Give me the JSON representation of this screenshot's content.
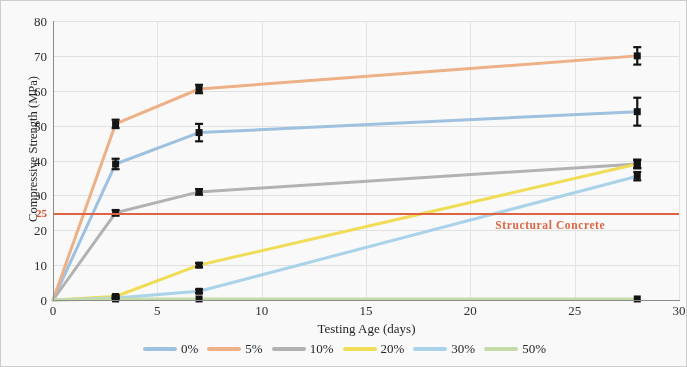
{
  "chart_data": {
    "type": "line",
    "title": "",
    "xlabel": "Testing Age (days)",
    "ylabel": "Compressive Strength (MPa)",
    "xlim": [
      0,
      30
    ],
    "ylim": [
      0,
      80
    ],
    "xticks": [
      0,
      5,
      10,
      15,
      20,
      25,
      30
    ],
    "yticks": [
      0,
      10,
      20,
      30,
      40,
      50,
      60,
      70,
      80
    ],
    "grid": true,
    "legend_position": "bottom",
    "x": [
      0,
      3,
      7,
      28
    ],
    "series": [
      {
        "name": "0%",
        "color": "#9dc3e6",
        "values": [
          0,
          39,
          48,
          54
        ],
        "errors": [
          0,
          1.5,
          2.5,
          4
        ]
      },
      {
        "name": "5%",
        "color": "#f4b183",
        "values": [
          0,
          50.5,
          60.5,
          70
        ],
        "errors": [
          0,
          1.2,
          1.2,
          2.5
        ]
      },
      {
        "name": "10%",
        "color": "#b4b4b4",
        "values": [
          0,
          25,
          31,
          39
        ],
        "errors": [
          0,
          0.8,
          0.8,
          1.2
        ]
      },
      {
        "name": "20%",
        "color": "#f5e04a",
        "values": [
          0,
          1,
          10,
          39
        ],
        "errors": [
          0,
          0.4,
          0.6,
          1.2
        ]
      },
      {
        "name": "30%",
        "color": "#a9d5ef",
        "values": [
          0,
          0.6,
          2.5,
          35.5
        ],
        "errors": [
          0,
          0.3,
          0.5,
          1.2
        ]
      },
      {
        "name": "50%",
        "color": "#c5e0a5",
        "values": [
          0,
          0.3,
          0.3,
          0.3
        ],
        "errors": [
          0,
          0,
          0,
          0
        ]
      }
    ],
    "threshold": {
      "value": 25,
      "label": "Structural Concrete",
      "color": "#e8603c",
      "tick_label": "25"
    }
  },
  "axis": {
    "y_tick_labels": [
      "0",
      "10",
      "20",
      "30",
      "40",
      "50",
      "60",
      "70",
      "80"
    ],
    "x_tick_labels": [
      "0",
      "5",
      "10",
      "15",
      "20",
      "25",
      "30"
    ],
    "y_title": "Compressive Strength (MPa)",
    "x_title": "Testing Age (days)",
    "special_y_label": "25"
  },
  "legend": {
    "items": [
      {
        "label": "0%",
        "color": "#9dc3e6"
      },
      {
        "label": "5%",
        "color": "#f4b183"
      },
      {
        "label": "10%",
        "color": "#b4b4b4"
      },
      {
        "label": "20%",
        "color": "#f5e04a"
      },
      {
        "label": "30%",
        "color": "#a9d5ef"
      },
      {
        "label": "50%",
        "color": "#c5e0a5"
      }
    ]
  }
}
